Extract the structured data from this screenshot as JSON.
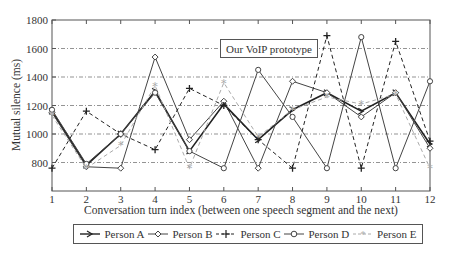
{
  "chart_data": {
    "type": "line",
    "title": "",
    "annotation": "Our VoIP prototype",
    "xlabel": "Conversation turn index (between one speech segment and the next)",
    "ylabel": "Mutual silence (ms)",
    "x": [
      1,
      2,
      3,
      4,
      5,
      6,
      7,
      8,
      9,
      10,
      11,
      12
    ],
    "xlim": [
      1,
      12
    ],
    "ylim": [
      600,
      1800
    ],
    "yticks": [
      800,
      1000,
      1200,
      1400,
      1600,
      1800
    ],
    "grid": "horizontal dash-dot",
    "legend_position": "bottom",
    "series": [
      {
        "name": "Person A",
        "marker": "arrow",
        "style": "solid-thick",
        "color": "#222222",
        "values": [
          1160,
          780,
          1000,
          1300,
          880,
          1210,
          960,
          1170,
          1290,
          1160,
          1290,
          930
        ]
      },
      {
        "name": "Person B",
        "marker": "diamond",
        "style": "solid",
        "color": "#444444",
        "values": [
          1150,
          770,
          760,
          1540,
          960,
          1230,
          760,
          1370,
          1290,
          1120,
          1290,
          900
        ]
      },
      {
        "name": "Person C",
        "marker": "plus",
        "style": "dashed",
        "color": "#222222",
        "values": [
          760,
          1160,
          1000,
          890,
          1320,
          1200,
          960,
          760,
          1690,
          760,
          1650,
          950
        ]
      },
      {
        "name": "Person D",
        "marker": "circle",
        "style": "solid",
        "color": "#444444",
        "values": [
          1170,
          790,
          1000,
          1290,
          880,
          760,
          1450,
          1120,
          760,
          1680,
          760,
          1370
        ]
      },
      {
        "name": "Person E",
        "marker": "star",
        "style": "dashed-gray",
        "color": "#aaaaaa",
        "values": [
          1130,
          760,
          920,
          1340,
          760,
          1360,
          980,
          1170,
          1260,
          1210,
          1280,
          760
        ]
      }
    ]
  },
  "legend": {
    "items": [
      {
        "label": "Person A"
      },
      {
        "label": "Person B"
      },
      {
        "label": "Person C"
      },
      {
        "label": "Person D"
      },
      {
        "label": "Person E"
      }
    ]
  }
}
